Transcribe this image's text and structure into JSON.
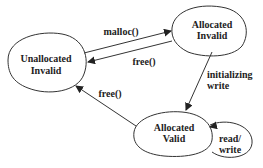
{
  "diagram": {
    "type": "state-diagram",
    "states": [
      {
        "id": "unallocated_invalid",
        "line1": "Unallocated",
        "line2": "Invalid"
      },
      {
        "id": "allocated_invalid",
        "line1": "Allocated",
        "line2": "Invalid"
      },
      {
        "id": "allocated_valid",
        "line1": "Allocated",
        "line2": "Valid"
      }
    ],
    "transitions": [
      {
        "from": "unallocated_invalid",
        "to": "allocated_invalid",
        "label": "malloc()"
      },
      {
        "from": "allocated_invalid",
        "to": "unallocated_invalid",
        "label": "free()"
      },
      {
        "from": "allocated_invalid",
        "to": "allocated_valid",
        "line1": "initializing",
        "line2": "write"
      },
      {
        "from": "allocated_valid",
        "to": "unallocated_invalid",
        "label": "free()"
      },
      {
        "from": "allocated_valid",
        "to": "allocated_valid",
        "line1": "read/",
        "line2": "write"
      }
    ]
  }
}
